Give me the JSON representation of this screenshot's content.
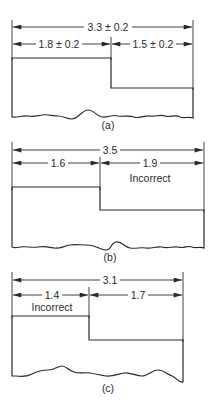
{
  "figures": [
    {
      "id": "a",
      "caption": "(a)",
      "overall_dimension": "3.3 ± 0.2",
      "left_dimension": "1.8 ± 0.2",
      "right_dimension": "1.5 ± 0.2",
      "note": ""
    },
    {
      "id": "b",
      "caption": "(b)",
      "overall_dimension": "3.5",
      "left_dimension": "1.6",
      "right_dimension": "1.9",
      "note": "Incorrect"
    },
    {
      "id": "c",
      "caption": "(c)",
      "overall_dimension": "3.1",
      "left_dimension": "1.4",
      "right_dimension": "1.7",
      "note": "Incorrect"
    }
  ]
}
